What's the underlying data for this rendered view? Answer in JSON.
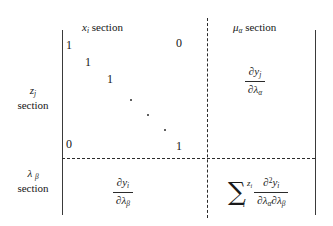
{
  "figure": {
    "background": "#ffffff",
    "ink": "#161616",
    "rule_color": "#2b2b2b"
  },
  "columns": [
    {
      "id": "x-section",
      "symbol": "x",
      "sub": "i",
      "label": "section"
    },
    {
      "id": "mu-section",
      "symbol": "μ",
      "sub": "α",
      "label": "section"
    }
  ],
  "rows": [
    {
      "id": "z-section",
      "symbol": "z",
      "sub": "j",
      "label": "section"
    },
    {
      "id": "lambda-section",
      "symbol": "λ",
      "sub": "β",
      "label": "section"
    }
  ],
  "matrix_block": {
    "description": "identity matrix block",
    "entries": [
      {
        "value": "1",
        "x": 66,
        "y": 38
      },
      {
        "value": "0",
        "x": 176,
        "y": 36
      },
      {
        "value": "1",
        "x": 85,
        "y": 55
      },
      {
        "value": "1",
        "x": 107,
        "y": 72
      },
      {
        "value": "0",
        "x": 66,
        "y": 137
      },
      {
        "value": "1",
        "x": 176,
        "y": 139
      }
    ],
    "ellipsis_dots": [
      {
        "x": 130,
        "y": 99
      },
      {
        "x": 147,
        "y": 114
      },
      {
        "x": 164,
        "y": 129
      }
    ]
  },
  "cells": {
    "top_right": {
      "id": "dy-dlambda-alpha",
      "numerator": {
        "partial": "∂",
        "fn": "y",
        "sub": "j"
      },
      "denominator": {
        "partial": "∂",
        "fn": "λ",
        "sub": "α"
      }
    },
    "bottom_left": {
      "id": "dy-dlambda-beta",
      "numerator": {
        "partial": "∂",
        "fn": "y",
        "sub": "i"
      },
      "denominator": {
        "partial": "∂",
        "fn": "λ",
        "sub": "β"
      }
    },
    "bottom_right": {
      "id": "sum-z-second-derivative",
      "sigma": "∑",
      "sigma_sub": "i",
      "factor": {
        "symbol": "z",
        "sub": "i"
      },
      "numerator": {
        "partial": "∂",
        "power": "2",
        "fn": "y",
        "sub": "i"
      },
      "denominator": {
        "partial1": "∂",
        "fn1": "λ",
        "sub1": "α",
        "partial2": "∂",
        "fn2": "λ",
        "sub2": "β"
      }
    }
  },
  "rules": {
    "left_bar": {
      "x": 62,
      "y": 30,
      "height": 185
    },
    "right_bar": {
      "x": 315,
      "y": 30,
      "height": 185
    },
    "dashed_vertical": {
      "x": 207,
      "y": 18,
      "height": 200
    },
    "dashed_horizontal": {
      "x": 62,
      "y": 158,
      "width": 253
    }
  }
}
